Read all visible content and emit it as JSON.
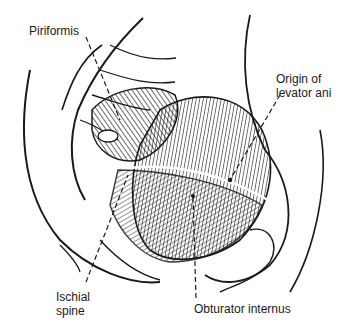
{
  "figure": {
    "labels": {
      "piriformis": "Piriformis",
      "origin_levator_line1": "Origin of",
      "origin_levator_line2": "levator ani",
      "ischial_line1": "Ischial",
      "ischial_line2": "spine",
      "obturator": "Obturator internus"
    }
  },
  "colors": {
    "ink": "#1a1a1a",
    "background": "#ffffff"
  }
}
